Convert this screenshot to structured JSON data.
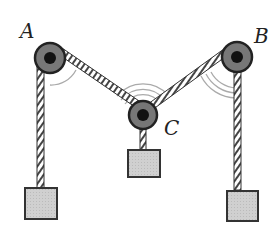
{
  "diagram": {
    "type": "pulley-system",
    "labels": {
      "a": "A",
      "b": "B",
      "c": "C"
    },
    "colors": {
      "pulley_outer": "#555555",
      "pulley_inner": "#1a1a1a",
      "mass_fill": "#cfcfcf",
      "rope": "#333333",
      "arc": "#aaaaaa"
    }
  }
}
